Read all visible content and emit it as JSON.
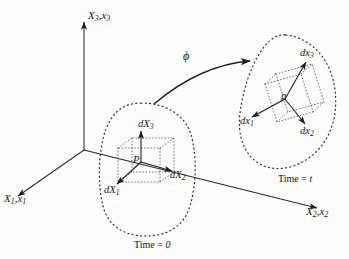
{
  "figure": {
    "background_color": "#fdfdfc",
    "ink_color": "#1c1c1c"
  },
  "axes": [
    {
      "name": "x1-axis",
      "label_main": "X",
      "label_main_sub": "1",
      "label_alt": "x",
      "label_alt_sub": "1",
      "text": "X1,x1"
    },
    {
      "name": "x2-axis",
      "label_main": "X",
      "label_main_sub": "2",
      "label_alt": "x",
      "label_alt_sub": "2",
      "text": "X2,x2"
    },
    {
      "name": "x3-axis",
      "label_main": "X",
      "label_main_sub": "3",
      "label_alt": "x",
      "label_alt_sub": "3",
      "text": "X3,x3"
    }
  ],
  "reference_configuration": {
    "name": "reference-body",
    "time_label_prefix": "Time = ",
    "time_label_value": "0",
    "point_label": "P",
    "vectors": [
      {
        "name": "dX1",
        "base": "dX",
        "sub": "1"
      },
      {
        "name": "dX2",
        "base": "dX",
        "sub": "2"
      },
      {
        "name": "dX3",
        "base": "dX",
        "sub": "3"
      }
    ]
  },
  "current_configuration": {
    "name": "deformed-body",
    "time_label_prefix": "Time = ",
    "time_label_value": "t",
    "point_label": "p",
    "vectors": [
      {
        "name": "dx1",
        "base": "dx",
        "sub": "1"
      },
      {
        "name": "dx2",
        "base": "dx",
        "sub": "2"
      },
      {
        "name": "dx3",
        "base": "dx",
        "sub": "3"
      }
    ]
  },
  "mapping": {
    "name": "deformation-map",
    "symbol": "ϕ"
  }
}
